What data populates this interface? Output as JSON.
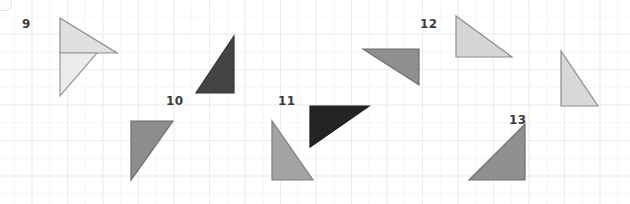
{
  "page": {
    "width": 630,
    "height": 204,
    "background_color": "#ffffff",
    "grid_color": "#ededf0",
    "grid_spacing_px": 35.5
  },
  "labels": [
    {
      "name": "label-9",
      "text": "9",
      "x": 22,
      "y": 18
    },
    {
      "name": "label-10",
      "text": "10",
      "x": 166,
      "y": 95
    },
    {
      "name": "label-11",
      "text": "11",
      "x": 278,
      "y": 95
    },
    {
      "name": "label-12",
      "text": "12",
      "x": 420,
      "y": 18
    },
    {
      "name": "label-13",
      "text": "13",
      "x": 509,
      "y": 114
    }
  ],
  "shapes": [
    {
      "name": "triangle-9-upper",
      "group": "9",
      "fill": "#e0e0e0",
      "stroke": "#8a8a8a",
      "points": "60,18 117,53 60,53",
      "description": "right triangle, right angle at bottom-left, hypotenuse from top-left down to right"
    },
    {
      "name": "triangle-9-lower",
      "group": "9",
      "fill": "#ececec",
      "stroke": "#9a9a9a",
      "points": "60,53 97,53 60,96",
      "description": "right triangle, right angle at top-left, pointing down"
    },
    {
      "name": "triangle-10-upper",
      "group": "10",
      "fill": "#444444",
      "stroke": "#333333",
      "points": "234,36 234,93 196,93",
      "description": "dark right triangle, right angle at bottom-right"
    },
    {
      "name": "triangle-10-lower",
      "group": "10",
      "fill": "#8d8d8d",
      "stroke": "#6d6d6d",
      "points": "131,121 173,121 131,180",
      "description": "medium gray right triangle, right angle at top-left"
    },
    {
      "name": "triangle-11-dark",
      "group": "11",
      "fill": "#242424",
      "stroke": "#1c1c1c",
      "points": "310,106 369,106 310,147",
      "description": "near-black right triangle, right angle at top-left"
    },
    {
      "name": "triangle-11-gray",
      "group": "11",
      "fill": "#a3a3a3",
      "stroke": "#7d7d7d",
      "points": "272,121 272,180 313,180",
      "description": "medium gray right triangle, right angle at bottom-right"
    },
    {
      "name": "triangle-12-left",
      "group": "12",
      "fill": "#8f8f8f",
      "stroke": "#6f6f6f",
      "points": "363,49 419,49 419,85",
      "description": "medium gray right triangle, right angle at bottom-right"
    },
    {
      "name": "triangle-12-upper",
      "group": "12",
      "fill": "#d6d6d6",
      "stroke": "#8c8c8c",
      "points": "456,16 456,57 512,57",
      "description": "light gray right triangle, right angle at bottom-left"
    },
    {
      "name": "triangle-12-right",
      "group": "12",
      "fill": "#d8d8d8",
      "stroke": "#8e8e8e",
      "points": "561,51 561,106 598,106",
      "description": "light gray right triangle, right angle at bottom-right"
    },
    {
      "name": "triangle-13",
      "group": "13",
      "fill": "#909090",
      "stroke": "#707070",
      "points": "525,124 525,180 469,180",
      "description": "medium gray right triangle, right angle at bottom-right"
    }
  ]
}
